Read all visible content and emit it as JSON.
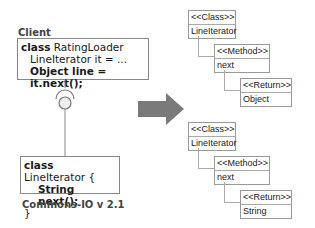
{
  "client": {
    "label": "Client",
    "line1_kw": "class",
    "line1_rest": " RatingLoader",
    "line2": "LineIterator it = ...",
    "line3_a": "Object ",
    "line3_b": "line = it.next();"
  },
  "library": {
    "line1_kw": "class",
    "line1_rest": " LineIterator {",
    "line2_a": "String ",
    "line2_b": "next();",
    "line3": "}",
    "label": "Commons-IO v 2.1"
  },
  "arrow": {
    "color": "#7a7a7a"
  },
  "old_tree": {
    "class_stereo": "<<Class>>",
    "class_name": "LineIterator",
    "method_stereo": "<<Method>>",
    "method_name": "next",
    "return_stereo": "<<Return>>",
    "return_type": "Object"
  },
  "new_tree": {
    "class_stereo": "<<Class>>",
    "class_name": "LineIterator",
    "method_stereo": "<<Method>>",
    "method_name": "next",
    "return_stereo": "<<Return>>",
    "return_type": "String"
  }
}
